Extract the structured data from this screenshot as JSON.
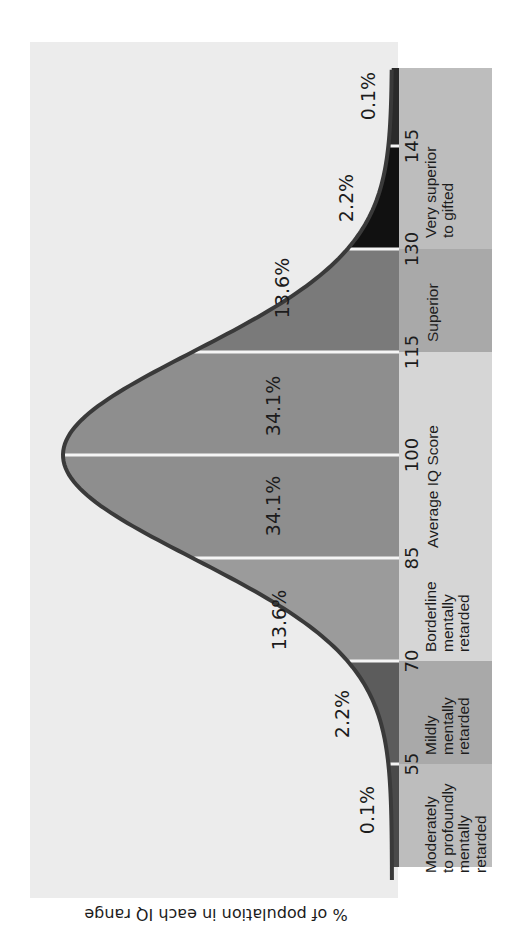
{
  "chart_data": {
    "type": "area",
    "title": "",
    "orientation": "rotated 90° counter-clockwise (IQ axis runs bottom→top on screen)",
    "distribution": {
      "kind": "normal",
      "mean": 100,
      "sd": 15
    },
    "xlabel": "IQ score",
    "ylabel": "% of population in each IQ range",
    "caption": "% of population in each IQ range",
    "grid": false,
    "legend": "none",
    "ticks": [
      "55",
      "70",
      "85",
      "100",
      "115",
      "130",
      "145"
    ],
    "bands": [
      {
        "range": [
          40,
          55
        ],
        "percent": "0.1%",
        "value": 0.1,
        "label": [
          "Moderately",
          "to profoundly",
          "mentally",
          "retarded"
        ],
        "fill": "#4a4a4a",
        "band_fill": "#bdbdbd"
      },
      {
        "range": [
          55,
          70
        ],
        "percent": "2.2%",
        "value": 2.2,
        "label": [
          "Mildly",
          "mentally",
          "retarded"
        ],
        "fill": "#5c5c5c",
        "band_fill": "#a9a9a9"
      },
      {
        "range": [
          70,
          85
        ],
        "percent": "13.6%",
        "value": 13.6,
        "label": [
          "Borderline",
          "mentally",
          "retarded"
        ],
        "fill": "#9b9b9b",
        "band_fill": "#d6d6d6"
      },
      {
        "range": [
          85,
          100
        ],
        "percent": "34.1%",
        "value": 34.1,
        "label": [
          "Average IQ Score"
        ],
        "fill": "#8e8e8e",
        "band_fill": "#d6d6d6"
      },
      {
        "range": [
          100,
          115
        ],
        "percent": "34.1%",
        "value": 34.1,
        "label": [],
        "fill": "#8e8e8e",
        "band_fill": "#d6d6d6"
      },
      {
        "range": [
          115,
          130
        ],
        "percent": "13.6%",
        "value": 13.6,
        "label": [
          "Superior"
        ],
        "fill": "#7a7a7a",
        "band_fill": "#a9a9a9"
      },
      {
        "range": [
          130,
          145
        ],
        "percent": "2.2%",
        "value": 2.2,
        "label": [
          "Very superior",
          "to gifted"
        ],
        "fill": "#111111",
        "band_fill": "#bdbdbd"
      },
      {
        "range": [
          145,
          160
        ],
        "percent": "0.1%",
        "value": 0.1,
        "label": [],
        "fill": "#2a2a2a",
        "band_fill": "#bdbdbd"
      }
    ],
    "categories": [
      "<55",
      "55–70",
      "70–85",
      "85–100",
      "100–115",
      "115–130",
      "130–145",
      ">145"
    ],
    "values": [
      0.1,
      2.2,
      13.6,
      34.1,
      34.1,
      13.6,
      2.2,
      0.1
    ]
  },
  "colors": {
    "plot_bg": "#ececec",
    "curve_stroke": "#3a3a3a",
    "divider": "#f5f5f5"
  }
}
